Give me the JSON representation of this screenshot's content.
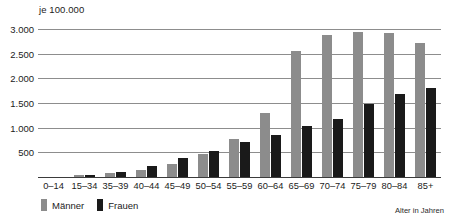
{
  "unit_caption": "je 100.000",
  "axis_caption": "Alter in Jahren",
  "legend": {
    "items": [
      {
        "label": "Männer",
        "color": "#8c8c8c"
      },
      {
        "label": "Frauen",
        "color": "#1a1a1a"
      }
    ]
  },
  "y_ticks": [
    "500",
    "1.000",
    "1.500",
    "2.000",
    "2.500",
    "3.000"
  ],
  "colors": {
    "male": "#8c8c8c",
    "female": "#1a1a1a",
    "gridline": "#8d8d8d",
    "axis": "#3b3b3b",
    "text": "#1b1b1b",
    "background": "#ffffff"
  },
  "chart_data": {
    "type": "bar",
    "title": "",
    "subtitle": "",
    "xlabel": "Alter in Jahren",
    "ylabel": "je 100.000",
    "ylim": [
      0,
      3000
    ],
    "ytick_values": [
      500,
      1000,
      1500,
      2000,
      2500,
      3000
    ],
    "grid": true,
    "legend_position": "bottom-left",
    "categories": [
      "0–14",
      "15–34",
      "35–39",
      "40–44",
      "45–49",
      "50–54",
      "55–59",
      "60–64",
      "65–69",
      "70–74",
      "75–79",
      "80–84",
      "85+"
    ],
    "series": [
      {
        "name": "Männer",
        "color": "#8c8c8c",
        "values": [
          10,
          55,
          110,
          170,
          290,
          480,
          800,
          1320,
          2580,
          2900,
          2950,
          2940,
          2730
        ]
      },
      {
        "name": "Frauen",
        "color": "#1a1a1a",
        "values": [
          10,
          60,
          130,
          250,
          400,
          540,
          730,
          870,
          1050,
          1200,
          1510,
          1700,
          1830
        ]
      }
    ]
  }
}
